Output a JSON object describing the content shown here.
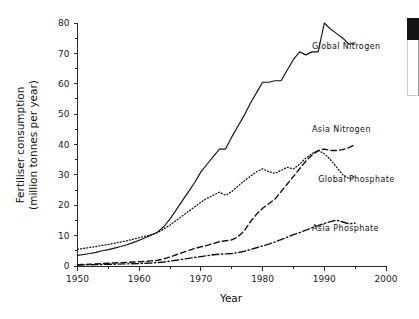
{
  "chart_data": {
    "type": "line",
    "title": "",
    "xlabel": "Year",
    "ylabel": "Fertiliser consumption\n(million tonnes per year)",
    "ylabel_line1": "Fertiliser consumption",
    "ylabel_line2": "(million tonnes per year)",
    "xlim": [
      1950,
      2000
    ],
    "ylim": [
      0,
      80
    ],
    "xticks": [
      1950,
      1960,
      1970,
      1980,
      1990,
      2000
    ],
    "xticklabels": [
      "1950",
      "1960",
      "1970",
      "1980",
      "1990",
      "2000"
    ],
    "xminorticks": [
      1955,
      1965,
      1975,
      1985,
      1995
    ],
    "yticks": [
      0,
      10,
      20,
      30,
      40,
      50,
      60,
      70,
      80
    ],
    "yticklabels": [
      "0",
      "10",
      "20",
      "30",
      "40",
      "50",
      "60",
      "70",
      "80"
    ],
    "yminorticks": [
      5,
      15,
      25,
      35,
      45,
      55,
      65,
      75
    ],
    "grid": false,
    "legend_position": "inline-labels",
    "series": [
      {
        "name": "Global Nitrogen",
        "linestyle": "solid",
        "color": "#111111",
        "label_x": 1988,
        "label_y": 71.5,
        "x": [
          1950,
          1951,
          1952,
          1953,
          1954,
          1955,
          1956,
          1957,
          1958,
          1959,
          1960,
          1961,
          1962,
          1963,
          1964,
          1965,
          1966,
          1967,
          1968,
          1969,
          1970,
          1971,
          1972,
          1973,
          1974,
          1975,
          1976,
          1977,
          1978,
          1979,
          1980,
          1981,
          1982,
          1983,
          1984,
          1985,
          1986,
          1987,
          1988,
          1989,
          1990,
          1991,
          1992,
          1993,
          1994,
          1995
        ],
        "values": [
          3.5,
          3.8,
          4.1,
          4.5,
          5.0,
          5.4,
          5.9,
          6.4,
          7.0,
          7.7,
          8.5,
          9.3,
          10.2,
          11.2,
          13.0,
          15.5,
          18.5,
          21.5,
          24.5,
          27.5,
          31.0,
          33.5,
          36.0,
          38.5,
          38.5,
          42.5,
          46.0,
          49.5,
          53.5,
          57.0,
          60.5,
          60.5,
          61.0,
          61.0,
          64.5,
          68.0,
          70.5,
          69.5,
          70.5,
          70.5,
          80.0,
          78.0,
          76.5,
          75.0,
          73.0,
          73.5
        ]
      },
      {
        "name": "Global Phosphate",
        "linestyle": "dotted",
        "color": "#111111",
        "label_x": 1989,
        "label_y": 27.5,
        "x": [
          1950,
          1951,
          1952,
          1953,
          1954,
          1955,
          1956,
          1957,
          1958,
          1959,
          1960,
          1961,
          1962,
          1963,
          1964,
          1965,
          1966,
          1967,
          1968,
          1969,
          1970,
          1971,
          1972,
          1973,
          1974,
          1975,
          1976,
          1977,
          1978,
          1979,
          1980,
          1981,
          1982,
          1983,
          1984,
          1985,
          1986,
          1987,
          1988,
          1989,
          1990,
          1991,
          1992,
          1993,
          1994,
          1995
        ],
        "values": [
          5.5,
          5.8,
          6.1,
          6.4,
          6.8,
          7.1,
          7.5,
          7.9,
          8.3,
          8.8,
          9.3,
          9.8,
          10.3,
          11.0,
          12.2,
          13.5,
          15.0,
          16.5,
          18.0,
          19.5,
          21.0,
          22.3,
          23.3,
          24.3,
          23.3,
          24.5,
          26.3,
          28.0,
          29.5,
          31.0,
          32.0,
          31.0,
          30.5,
          31.5,
          32.5,
          32.0,
          33.5,
          35.5,
          37.0,
          38.0,
          37.0,
          35.0,
          32.5,
          30.0,
          28.8,
          29.5
        ]
      },
      {
        "name": "Asia Nitrogen",
        "linestyle": "dashed",
        "color": "#111111",
        "label_x": 1988,
        "label_y": 44.0,
        "x": [
          1950,
          1952,
          1954,
          1955,
          1956,
          1957,
          1958,
          1959,
          1960,
          1961,
          1962,
          1963,
          1964,
          1965,
          1966,
          1967,
          1968,
          1969,
          1970,
          1971,
          1972,
          1973,
          1974,
          1975,
          1976,
          1977,
          1978,
          1979,
          1980,
          1981,
          1982,
          1983,
          1984,
          1985,
          1986,
          1987,
          1988,
          1989,
          1990,
          1991,
          1992,
          1993,
          1994,
          1995
        ],
        "values": [
          0.4,
          0.6,
          0.8,
          0.9,
          1.0,
          1.1,
          1.2,
          1.3,
          1.4,
          1.5,
          1.7,
          1.9,
          2.3,
          3.0,
          3.7,
          4.4,
          5.1,
          5.8,
          6.3,
          6.8,
          7.4,
          8.0,
          8.3,
          8.6,
          9.6,
          11.5,
          14.5,
          17.0,
          19.0,
          20.5,
          22.0,
          24.5,
          27.0,
          29.5,
          32.0,
          34.5,
          36.5,
          38.0,
          38.5,
          38.0,
          38.0,
          38.3,
          39.0,
          40.0
        ]
      },
      {
        "name": "Asia Phosphate",
        "linestyle": "dashdot",
        "color": "#111111",
        "label_x": 1988,
        "label_y": 11.5,
        "x": [
          1950,
          1952,
          1954,
          1956,
          1958,
          1960,
          1962,
          1964,
          1965,
          1966,
          1967,
          1968,
          1969,
          1970,
          1971,
          1972,
          1973,
          1974,
          1975,
          1976,
          1977,
          1978,
          1979,
          1980,
          1981,
          1982,
          1983,
          1984,
          1985,
          1986,
          1987,
          1988,
          1989,
          1990,
          1991,
          1992,
          1993,
          1994,
          1995
        ],
        "values": [
          0.3,
          0.4,
          0.5,
          0.6,
          0.7,
          0.8,
          1.0,
          1.3,
          1.6,
          1.9,
          2.2,
          2.5,
          2.8,
          3.1,
          3.4,
          3.7,
          3.9,
          4.0,
          4.1,
          4.4,
          4.8,
          5.4,
          6.0,
          6.6,
          7.2,
          7.9,
          8.7,
          9.5,
          10.3,
          11.0,
          11.8,
          12.6,
          13.3,
          14.0,
          14.6,
          15.1,
          14.5,
          13.9,
          14.1
        ]
      }
    ]
  },
  "artifact": {
    "name": "right-edge-fragment",
    "color": "#141414"
  }
}
